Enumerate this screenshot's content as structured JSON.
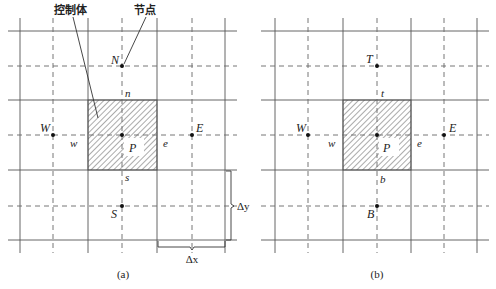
{
  "figure": {
    "type": "finite-volume grid schematic",
    "panels": [
      {
        "id": "a",
        "caption": "(a)",
        "annotations": {
          "control_volume_label": "控制体",
          "node_label": "节点"
        },
        "nodes": {
          "P": "P",
          "N": "N",
          "S": "S",
          "W": "W",
          "E": "E"
        },
        "faces": {
          "n": "n",
          "s": "s",
          "w": "w",
          "e": "e"
        },
        "dimensions": {
          "dx": "Δx",
          "dy": "Δy"
        }
      },
      {
        "id": "b",
        "caption": "(b)",
        "nodes": {
          "P": "P",
          "T": "T",
          "B": "B",
          "W": "W",
          "E": "E"
        },
        "faces": {
          "t": "t",
          "b": "b",
          "w": "w",
          "e": "e"
        }
      }
    ]
  },
  "colors": {
    "grid": "#555555",
    "node": "#111111",
    "hatch": "#444444",
    "background": "#ffffff"
  }
}
